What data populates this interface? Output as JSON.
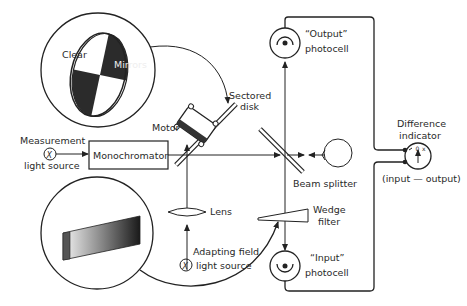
{
  "diagram": {
    "labels": {
      "clear": "Clear",
      "mirrors": "Mirrors",
      "sectored_disk_1": "Sectored",
      "sectored_disk_2": "disk",
      "motor": "Motor",
      "measurement_1": "Measurement",
      "measurement_2": "light source",
      "monochromator": "Monochromator",
      "lens": "Lens",
      "adapting_1": "Adapting field",
      "adapting_2": "light source",
      "output_1": "“Output”",
      "output_2": "photocell",
      "input_1": "“Input”",
      "input_2": "photocell",
      "beam_splitter": "Beam splitter",
      "wedge_1": "Wedge",
      "wedge_2": "filter",
      "difference_1": "Difference",
      "difference_2": "indicator",
      "difference_3": "(input — output)",
      "source_symbol": "X"
    },
    "colors": {
      "line": "#222222",
      "background": "#ffffff"
    }
  }
}
